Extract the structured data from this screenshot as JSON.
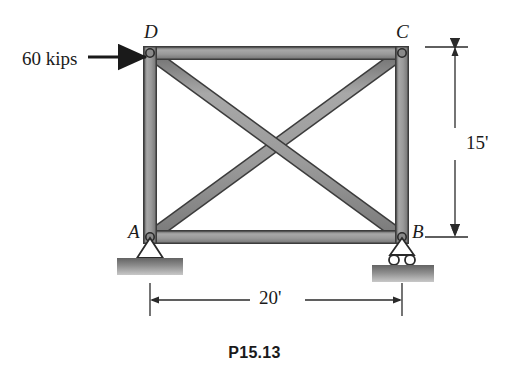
{
  "figure": {
    "caption": "P15.13",
    "type": "statics-truss-diagram"
  },
  "joints": {
    "D": {
      "label": "D",
      "x": 150,
      "y": 53
    },
    "C": {
      "label": "C",
      "x": 402,
      "y": 53
    },
    "A": {
      "label": "A",
      "x": 150,
      "y": 237
    },
    "B": {
      "label": "B",
      "x": 402,
      "y": 237
    }
  },
  "load": {
    "label": "60 kips",
    "direction": "right",
    "applied_at": "D"
  },
  "dimensions": {
    "height": "15'",
    "width": "20'"
  },
  "supports": {
    "A": "pin-support",
    "B": "roller-support"
  },
  "members": [
    "D-C",
    "A-B",
    "A-D",
    "B-C",
    "A-C",
    "D-B"
  ],
  "colors": {
    "member_fill": "#9a9a9a",
    "member_edge": "#3c3c3c",
    "base_fill": "#8f8f8f",
    "ink": "#1a1a1a",
    "background": "#ffffff"
  }
}
